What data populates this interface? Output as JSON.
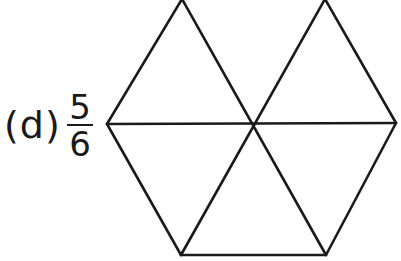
{
  "problem": {
    "label": "(d)",
    "fraction": {
      "numerator": "5",
      "denominator": "6"
    }
  },
  "figure": {
    "shape": "hexagon divided into 6 equilateral triangles",
    "note": "top edge of hexagon not drawn",
    "stroke_color": "#1a1a1a",
    "vertices": {
      "top_left": [
        182,
        -1
      ],
      "top_right": [
        325,
        -1
      ],
      "left": [
        107,
        124
      ],
      "center": [
        253,
        124
      ],
      "right": [
        396,
        123
      ],
      "bottom_left": [
        181,
        255
      ],
      "bottom_right": [
        326,
        255
      ]
    }
  }
}
